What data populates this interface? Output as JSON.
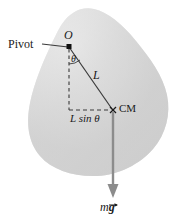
{
  "figure": {
    "type": "physics-diagram",
    "labels": {
      "pivot": "Pivot",
      "origin_point": "O",
      "angle": "θ",
      "length": "L",
      "horizontal_distance": "L sin θ",
      "center_of_mass": "CM",
      "weight_prefix": "m",
      "weight_vector": "g"
    },
    "colors": {
      "body_fill": "#d2d2d2",
      "body_fill_light": "#e3e3e3",
      "line": "#2b2b2b",
      "force_arrow": "#8c8c8c",
      "background": "#ffffff"
    },
    "geometry": {
      "pivot_x": 69,
      "pivot_y": 46,
      "cm_x": 113,
      "cm_y": 110,
      "arrow_tip_y": 197
    }
  }
}
